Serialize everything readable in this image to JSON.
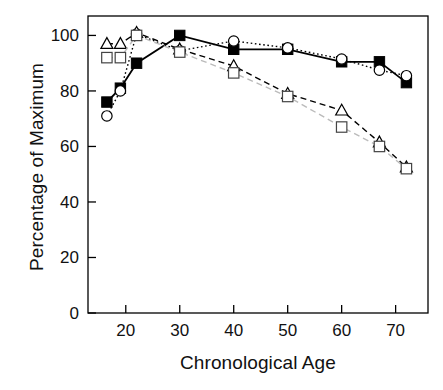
{
  "chart_data": {
    "type": "line",
    "title": "",
    "xlabel": "Chronological Age",
    "ylabel": "Percentage of Maximum",
    "xlim": [
      13,
      76
    ],
    "ylim": [
      0,
      107
    ],
    "xticks": [
      20,
      30,
      40,
      50,
      60,
      70
    ],
    "yticks": [
      0,
      20,
      40,
      60,
      80,
      100
    ],
    "xtick_labels": [
      "20",
      "30",
      "40",
      "50",
      "60",
      "70"
    ],
    "ytick_labels": [
      "0",
      "20",
      "40",
      "60",
      "80",
      "100"
    ],
    "grid": false,
    "legend": "none",
    "frame": "box",
    "series": [
      {
        "name": "filled-square-solid",
        "marker": "filled-square",
        "line_style": "solid",
        "color": "#000000",
        "x": [
          16.5,
          19,
          22,
          30,
          40,
          50,
          60,
          67,
          72
        ],
        "values": [
          76,
          81,
          90,
          100,
          95,
          95,
          90.5,
          90.5,
          83
        ]
      },
      {
        "name": "open-circle-dotted",
        "marker": "open-circle",
        "line_style": "dotted",
        "color": "#000000",
        "x": [
          16.5,
          19,
          22,
          30,
          40,
          50,
          60,
          67,
          72
        ],
        "values": [
          71,
          80,
          100.5,
          94.5,
          98,
          95.5,
          91.5,
          87.5,
          85.5
        ]
      },
      {
        "name": "open-triangle-dashed",
        "marker": "open-triangle",
        "line_style": "dashed",
        "color": "#000000",
        "x": [
          16.5,
          19,
          22,
          30,
          40,
          50,
          60,
          67,
          72
        ],
        "values": [
          97,
          97,
          101,
          95,
          89,
          79,
          73,
          61.5,
          52.5
        ]
      },
      {
        "name": "open-square-dashed",
        "marker": "open-square",
        "line_style": "dashed",
        "color": "#BBBBBB",
        "x": [
          16.5,
          19,
          22,
          30,
          40,
          50,
          60,
          67,
          72
        ],
        "values": [
          92,
          92,
          100,
          94,
          86.5,
          78,
          67,
          60,
          52
        ]
      }
    ]
  }
}
